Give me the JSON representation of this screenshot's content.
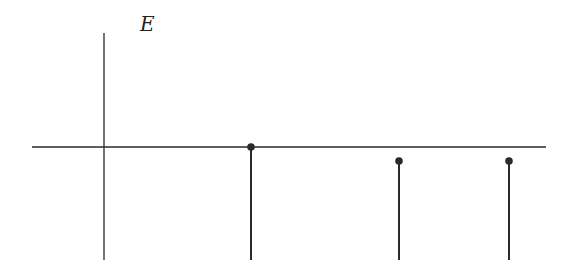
{
  "diagram": {
    "axis_label": "E",
    "colors": {
      "stroke": "#2a2a2a",
      "background": "#ffffff"
    },
    "axes": {
      "vertical": {
        "x": 104,
        "y_top": 33,
        "y_bottom": 260
      },
      "horizontal": {
        "y": 147,
        "x_left": 32,
        "x_right": 546
      }
    },
    "stems": [
      {
        "x": 251,
        "y_top": 147,
        "y_bottom": 260
      },
      {
        "x": 399,
        "y_top": 161,
        "y_bottom": 260
      },
      {
        "x": 509,
        "y_top": 161,
        "y_bottom": 260
      }
    ]
  }
}
